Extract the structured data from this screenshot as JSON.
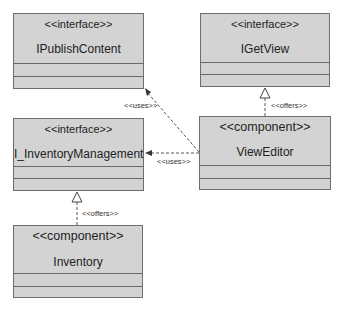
{
  "diagram": {
    "type": "UML component diagram",
    "colors": {
      "box_fill": "#d3d3d3",
      "box_border": "#6e6e6e",
      "line": "#555555"
    },
    "nodes": [
      {
        "id": "ipublish",
        "stereotype": "<<interface>>",
        "name": "IPublishContent"
      },
      {
        "id": "igetview",
        "stereotype": "<<interface>>",
        "name": "IGetView"
      },
      {
        "id": "iinventory",
        "stereotype": "<<interface>>",
        "name": "I_InventoryManagement"
      },
      {
        "id": "vieweditor",
        "stereotype": "<<component>>",
        "name": "ViewEditor"
      },
      {
        "id": "inventory",
        "stereotype": "<<component>>",
        "name": "Inventory"
      }
    ],
    "edges": [
      {
        "from": "vieweditor",
        "to": "ipublish",
        "label": "<<uses>>",
        "style": "dashed-arrow"
      },
      {
        "from": "vieweditor",
        "to": "igetview",
        "label": "<<offers>>",
        "style": "dashed-realization"
      },
      {
        "from": "vieweditor",
        "to": "iinventory",
        "label": "<<uses>>",
        "style": "dashed-arrow"
      },
      {
        "from": "inventory",
        "to": "iinventory",
        "label": "<<offers>>",
        "style": "dashed-realization"
      }
    ]
  }
}
